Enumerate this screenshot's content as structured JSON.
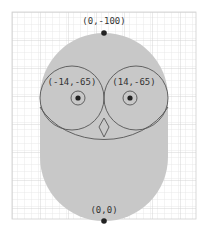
{
  "diagram": {
    "colors": {
      "background": "#ffffff",
      "grid_minor": "#e2e2e2",
      "grid_major": "#cfcfcf",
      "body_fill": "#c8c8c8",
      "stroke": "#555555",
      "point": "#222222",
      "label": "#333333"
    },
    "labels": {
      "top": "(0,-100)",
      "left_eye": "(-14,-65)",
      "right_eye": "(14,-65)",
      "bottom": "(0,0)"
    },
    "points": [
      {
        "name": "top",
        "coords": "(0,-100)"
      },
      {
        "name": "left-eye-center",
        "coords": "(-14,-65)"
      },
      {
        "name": "right-eye-center",
        "coords": "(14,-65)"
      },
      {
        "name": "origin",
        "coords": "(0,0)"
      }
    ]
  }
}
